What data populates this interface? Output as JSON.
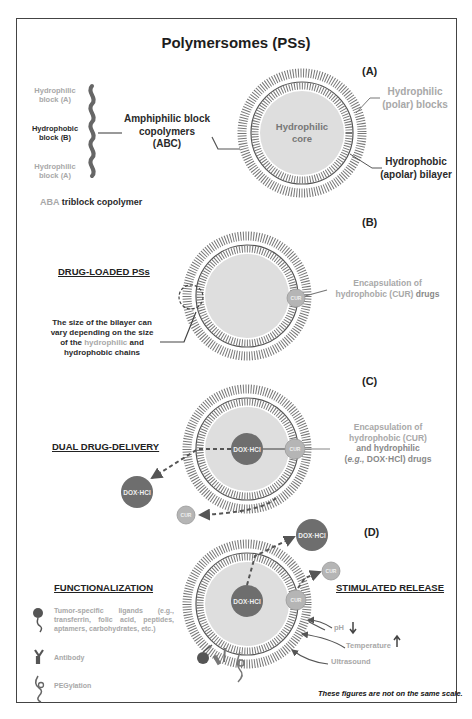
{
  "title": "Polymersomes (PSs)",
  "colors": {
    "frame": "#444444",
    "core_fill": "#dedede",
    "bilayer_line": "#555555",
    "dox_hcl_fill": "#6e6e6e",
    "cur_fill": "#b5b5b5",
    "light_text": "#a8a8a8",
    "dark_text": "#222222"
  },
  "panel_a": {
    "label": "(A)",
    "copolymer_blocks": [
      {
        "line1": "Hydrophilic",
        "line2": "block (A)",
        "tone": "light"
      },
      {
        "line1": "Hydrophobic",
        "line2": "block (B)",
        "tone": "dark"
      },
      {
        "line1": "Hydrophilic",
        "line2": "block (A)",
        "tone": "light"
      }
    ],
    "triblock_prefix": "ABA",
    "triblock_suffix": "triblock copolymer",
    "amphiphilic": {
      "line1": "Amphiphilic block",
      "line2": "copolymers",
      "line3": "(ABC)"
    },
    "core": {
      "line1": "Hydrophilic",
      "line2": "core"
    },
    "polar_blocks": {
      "line1": "Hydrophilic",
      "line2": "(polar) blocks"
    },
    "apolar_bilayer": {
      "line1": "Hydrophobic",
      "line2": "(apolar) bilayer"
    }
  },
  "panel_b": {
    "label": "(B)",
    "section_title": "DRUG-LOADED PSs",
    "bilayer_note": {
      "line1": "The size of the bilayer can",
      "line2": "vary depending on the size",
      "line3_pre": "of the",
      "line3_light": "hydrophilic",
      "line3_post": "and",
      "line4": "hydrophobic chains"
    },
    "encapsulation": {
      "line1": "Encapsulation of",
      "line2_light": "hydrophobic (CUR)",
      "line2_dark": "drugs"
    },
    "cur_label": "CUR"
  },
  "panel_c": {
    "label": "(C)",
    "section_title": "DUAL DRUG-DELIVERY",
    "encapsulation": {
      "line1": "Encapsulation of",
      "line2": "hydrophobic (CUR)",
      "line3": "and hydrophilic",
      "line4_italic": "e.g.,",
      "line4_rest": "DOX·HCl) drugs"
    },
    "dox_label": "DOX·HCl",
    "cur_label": "CUR"
  },
  "panel_d": {
    "label": "(D)",
    "functionalization_title": "FUNCTIONALIZATION",
    "stimulated_title": "STIMULATED RELEASE",
    "ligands": [
      {
        "icon": "ligand-icon",
        "text": "Tumor-specific ligands (e.g., transferrin, folic acid, peptides, aptamers, carbohydrates, etc.)"
      },
      {
        "icon": "antibody-icon",
        "text": "Antibody"
      },
      {
        "icon": "peg-icon",
        "text": "PEGylation"
      }
    ],
    "stimuli": [
      {
        "label": "pH",
        "arrow": "down"
      },
      {
        "label": "Temperature",
        "arrow": "up"
      },
      {
        "label": "Ultrasound",
        "arrow": ""
      }
    ],
    "dox_label": "DOX·HCl",
    "cur_label": "CUR"
  },
  "footnote": "These figures are not on the same scale."
}
